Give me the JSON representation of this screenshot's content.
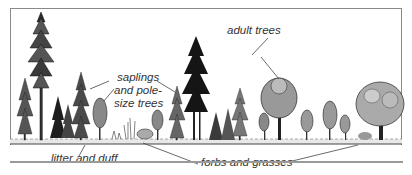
{
  "diagram": {
    "type": "forest-structure-illustration",
    "labels": {
      "saplings_line1": "saplings",
      "saplings_line2": "and pole-",
      "saplings_line3": "size trees",
      "adult_trees": "adult trees",
      "litter": "litter and duff",
      "forbs": "forbs and grasses"
    },
    "colors": {
      "ink": "#1a1a1a",
      "frame": "#8a8a8a",
      "label": "#333333"
    }
  }
}
